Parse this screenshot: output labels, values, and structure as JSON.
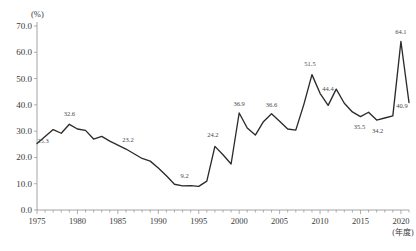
{
  "chart_data": {
    "type": "line",
    "title": "",
    "xlabel": "(年度)",
    "ylabel": "(%)",
    "ylim": [
      0.0,
      70.0
    ],
    "xlim": [
      1975,
      2021
    ],
    "grid": false,
    "legend": "none",
    "y_ticks": [
      "0.0",
      "10.0",
      "20.0",
      "30.0",
      "40.0",
      "50.0",
      "60.0",
      "70.0"
    ],
    "y_tick_values": [
      0.0,
      10.0,
      20.0,
      30.0,
      40.0,
      50.0,
      60.0,
      70.0
    ],
    "x_ticks": [
      "1975",
      "1980",
      "1985",
      "1990",
      "1995",
      "2000",
      "2005",
      "2010",
      "2015",
      "2020"
    ],
    "x_tick_values": [
      1975,
      1980,
      1985,
      1990,
      1995,
      2000,
      2005,
      2010,
      2015,
      2020
    ],
    "x": [
      1975,
      1976,
      1977,
      1978,
      1979,
      1980,
      1981,
      1982,
      1983,
      1984,
      1985,
      1986,
      1987,
      1988,
      1989,
      1990,
      1991,
      1992,
      1993,
      1994,
      1995,
      1996,
      1997,
      1998,
      1999,
      2000,
      2001,
      2002,
      2003,
      2004,
      2005,
      2006,
      2007,
      2008,
      2009,
      2010,
      2011,
      2012,
      2013,
      2014,
      2015,
      2016,
      2017,
      2018,
      2019,
      2020,
      2021
    ],
    "values": [
      25.3,
      28.0,
      30.6,
      29.2,
      32.6,
      30.8,
      30.3,
      27.0,
      28.0,
      26.2,
      24.7,
      23.2,
      21.4,
      19.6,
      18.6,
      16.0,
      13.0,
      9.8,
      9.2,
      9.3,
      9.0,
      11.0,
      24.2,
      21.0,
      17.5,
      36.9,
      31.2,
      28.5,
      33.6,
      36.6,
      33.8,
      30.8,
      30.4,
      40.2,
      51.5,
      44.4,
      39.8,
      46.0,
      40.6,
      37.3,
      35.5,
      37.2,
      34.2,
      35.0,
      35.8,
      64.1,
      40.9
    ],
    "annotations": [
      {
        "x": 1975,
        "value": 25.3,
        "label": "25.3"
      },
      {
        "x": 1979,
        "value": 32.6,
        "label": "32.6"
      },
      {
        "x": 1986,
        "value": 23.2,
        "label": "23.2"
      },
      {
        "x": 1993,
        "value": 9.2,
        "label": "9.2"
      },
      {
        "x": 1997,
        "value": 24.2,
        "label": "24.2"
      },
      {
        "x": 2000,
        "value": 36.9,
        "label": "36.9"
      },
      {
        "x": 2004,
        "value": 36.6,
        "label": "36.6"
      },
      {
        "x": 2009,
        "value": 51.5,
        "label": "51.5"
      },
      {
        "x": 2010,
        "value": 44.4,
        "label": "44.4"
      },
      {
        "x": 2015,
        "value": 35.5,
        "label": "35.5"
      },
      {
        "x": 2017,
        "value": 34.2,
        "label": "34.2"
      },
      {
        "x": 2020,
        "value": 64.1,
        "label": "64.1"
      },
      {
        "x": 2021,
        "value": 40.9,
        "label": "40.9"
      }
    ],
    "series_color": "#2b2b2b",
    "axis_color": "#9a9a9a",
    "text_color": "#3a3a3a"
  }
}
